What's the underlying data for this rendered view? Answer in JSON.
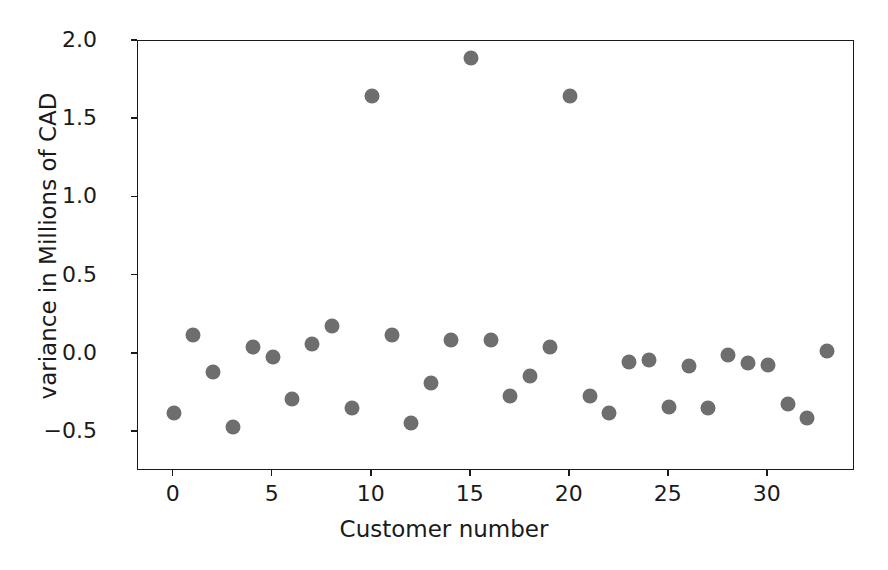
{
  "chart_data": {
    "type": "scatter",
    "title": "",
    "xlabel": "Customer number",
    "ylabel": "variance in Millions of CAD",
    "xlim": [
      -1.8,
      34.4
    ],
    "ylim": [
      -0.75,
      2.0
    ],
    "grid": false,
    "legend": null,
    "marker": {
      "shape": "circle",
      "color": "#6e6e6e",
      "size": 15
    },
    "xticks": [
      0,
      5,
      10,
      15,
      20,
      25,
      30
    ],
    "xticklabels": [
      "0",
      "5",
      "10",
      "15",
      "20",
      "25",
      "30"
    ],
    "yticks": [
      -0.5,
      0.0,
      0.5,
      1.0,
      1.5,
      2.0
    ],
    "yticklabels": [
      "−0.5",
      "0.0",
      "0.5",
      "1.0",
      "1.5",
      "2.0"
    ],
    "x": [
      0,
      1,
      2,
      3,
      4,
      5,
      6,
      7,
      8,
      9,
      10,
      11,
      12,
      13,
      14,
      15,
      16,
      17,
      18,
      19,
      20,
      21,
      22,
      23,
      24,
      25,
      26,
      27,
      28,
      29,
      30,
      31,
      32,
      33
    ],
    "y": [
      -0.38,
      0.12,
      -0.12,
      -0.47,
      0.04,
      -0.02,
      -0.29,
      0.06,
      0.18,
      -0.35,
      1.65,
      0.12,
      -0.44,
      -0.19,
      0.09,
      1.89,
      0.09,
      -0.27,
      -0.14,
      0.04,
      1.65,
      -0.27,
      -0.38,
      -0.05,
      -0.04,
      -0.34,
      -0.08,
      -0.35,
      -0.01,
      -0.06,
      -0.07,
      -0.32,
      -0.41,
      0.02
    ],
    "n_points": 34,
    "outliers": [
      {
        "x": 10,
        "y": 1.65
      },
      {
        "x": 15,
        "y": 1.89
      },
      {
        "x": 20,
        "y": 1.65
      }
    ]
  }
}
